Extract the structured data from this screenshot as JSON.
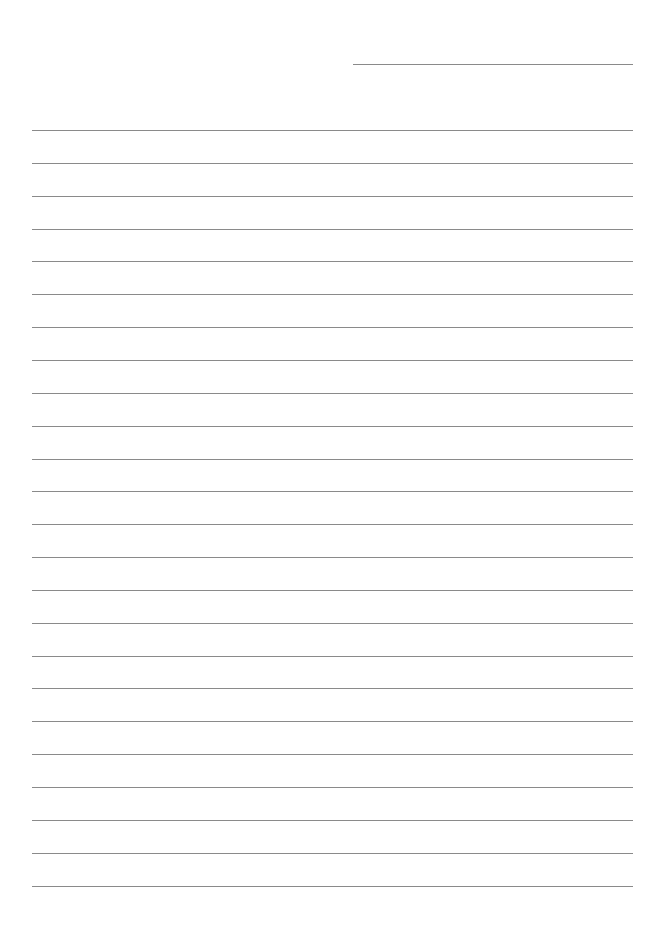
{
  "document": {
    "type": "lined-paper",
    "background_color": "#ffffff",
    "line_color": "#8a8a8a",
    "header_line": {
      "x": 353,
      "y": 64,
      "width": 280
    },
    "rules": {
      "count": 24,
      "x": 32,
      "width": 601,
      "first_y": 130,
      "spacing": 32.85
    }
  }
}
